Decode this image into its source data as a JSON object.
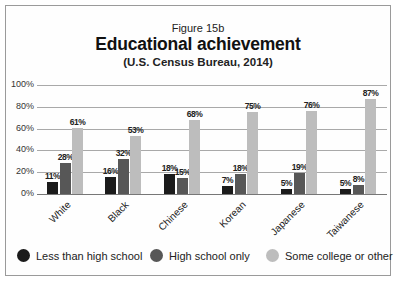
{
  "figure_label": "Figure 15b",
  "title": "Educational achievement",
  "subtitle": "(U.S. Census Bureau, 2014)",
  "colors": {
    "less_than_high_school": "#1b1b1b",
    "high_school_only": "#575757",
    "some_college_or_other": "#bdbdbd",
    "gridline": "#a9a9a9",
    "border": "#9a9a9a"
  },
  "legend": [
    {
      "label": "Less than high school",
      "color": "#1b1b1b"
    },
    {
      "label": "High school only",
      "color": "#575757"
    },
    {
      "label": "Some college or other",
      "color": "#bdbdbd"
    }
  ],
  "y_ticks": [
    "100%",
    "80%",
    "60%",
    "40%",
    "20%",
    "0%"
  ],
  "chart_data": {
    "type": "bar",
    "title": "Educational achievement",
    "subtitle": "(U.S. Census Bureau, 2014)",
    "figure_label": "Figure 15b",
    "xlabel": "",
    "ylabel": "",
    "ylim": [
      0,
      100
    ],
    "y_unit": "%",
    "y_ticks": [
      0,
      20,
      40,
      60,
      80,
      100
    ],
    "grid": true,
    "legend_position": "bottom",
    "categories": [
      "White",
      "Black",
      "Chinese",
      "Korean",
      "Japanese",
      "Taiwanese"
    ],
    "series": [
      {
        "name": "Less than high school",
        "values": [
          11,
          16,
          18,
          7,
          5,
          5
        ],
        "labels": [
          "11%",
          "16%",
          "18%",
          "7%",
          "5%",
          "5%"
        ]
      },
      {
        "name": "High school only",
        "values": [
          28,
          32,
          15,
          18,
          19,
          8
        ],
        "labels": [
          "28%",
          "32%",
          "15%",
          "18%",
          "19%",
          "8%"
        ]
      },
      {
        "name": "Some college or other",
        "values": [
          61,
          53,
          68,
          75,
          76,
          87
        ],
        "labels": [
          "61%",
          "53%",
          "68%",
          "75%",
          "76%",
          "87%"
        ]
      }
    ]
  }
}
